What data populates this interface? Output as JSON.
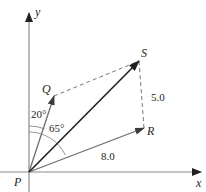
{
  "diagram": {
    "type": "vector-addition",
    "colors": {
      "axis": "#7d7d7d",
      "resultant": "#231f20",
      "component": "#6d6d6d",
      "dashed": "#777777",
      "text": "#231f20"
    },
    "axes": {
      "x_label": "x",
      "y_label": "y",
      "origin_label": "P"
    },
    "points": {
      "P": {
        "label": "P"
      },
      "Q": {
        "label": "Q"
      },
      "R": {
        "label": "R"
      },
      "S": {
        "label": "S"
      }
    },
    "vectors": [
      {
        "from": "P",
        "to": "Q",
        "name": "PQ"
      },
      {
        "from": "P",
        "to": "R",
        "name": "PR",
        "magnitude": "8.0"
      },
      {
        "from": "P",
        "to": "S",
        "name": "PS (resultant)"
      }
    ],
    "dashed_segments": [
      {
        "from": "Q",
        "to": "S"
      },
      {
        "from": "R",
        "to": "S",
        "magnitude": "5.0"
      }
    ],
    "angles": [
      {
        "label": "20°",
        "between": "y-axis and PQ"
      },
      {
        "label": "65°",
        "between": "y-axis and PR"
      }
    ],
    "magnitudes": {
      "PR": "8.0",
      "RS": "5.0"
    }
  }
}
